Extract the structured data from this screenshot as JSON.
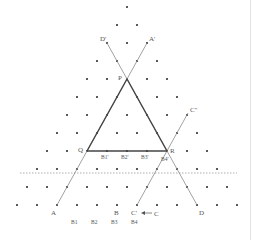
{
  "diagram": {
    "colors": {
      "dot": "#333333",
      "line_thin": "#8a8a8a",
      "line_thick": "#444444",
      "dotted": "#9a9a9a",
      "label": "#555555",
      "edge": "#e3e3e3"
    },
    "grid": {
      "origin_x": 127,
      "origin_y": 7,
      "dx": 20,
      "dy": 18,
      "rows": 12
    },
    "points": {
      "P": {
        "x": 127,
        "y": 79,
        "label": "P",
        "lx": 118,
        "ly": 80
      },
      "Q": {
        "x": 87,
        "y": 151,
        "label": "Q",
        "lx": 78,
        "ly": 152
      },
      "R": {
        "x": 167,
        "y": 151,
        "label": "R",
        "lx": 170,
        "ly": 153
      },
      "A": {
        "x": 57,
        "y": 205,
        "label": "A",
        "lx": 51,
        "ly": 215
      },
      "A_prime": {
        "x": 147,
        "y": 43,
        "label": "A'",
        "lx": 149,
        "ly": 41
      },
      "D_prime": {
        "x": 107,
        "y": 43,
        "label": "D'",
        "lx": 100,
        "ly": 41
      },
      "D": {
        "x": 197,
        "y": 205,
        "label": "D",
        "lx": 199,
        "ly": 215
      },
      "B": {
        "x": 117,
        "y": 205,
        "label": "B",
        "lx": 114,
        "ly": 215
      },
      "C_prime": {
        "x": 137,
        "y": 205,
        "label": "C'",
        "lx": 131,
        "ly": 215
      },
      "C": {
        "label": "C",
        "lx": 154,
        "ly": 216
      },
      "C_dprime": {
        "x": 188,
        "y": 113,
        "label": "C''",
        "lx": 190,
        "ly": 112
      }
    },
    "segment_labels": [
      {
        "label": "B1'",
        "x": 101,
        "y": 159
      },
      {
        "label": "B2'",
        "x": 121,
        "y": 159
      },
      {
        "label": "B3'",
        "x": 141,
        "y": 159
      },
      {
        "label": "B4'",
        "x": 161,
        "y": 161
      }
    ],
    "bottom_labels": [
      {
        "label": "B1",
        "x": 71,
        "y": 224
      },
      {
        "label": "B2",
        "x": 91,
        "y": 224
      },
      {
        "label": "B3",
        "x": 111,
        "y": 224
      },
      {
        "label": "B4",
        "x": 131,
        "y": 224
      }
    ],
    "arrow": {
      "label": "C' ← C",
      "from_x": 152,
      "to_x": 141,
      "y": 213
    },
    "dotted_line": {
      "x1": 20,
      "x2": 237,
      "y": 173
    }
  }
}
